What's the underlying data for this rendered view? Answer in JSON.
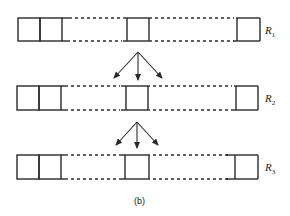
{
  "diagram": {
    "caption": "(b)",
    "rows": [
      {
        "label": "R",
        "subscript": "1"
      },
      {
        "label": "R",
        "subscript": "2"
      },
      {
        "label": "R",
        "subscript": "3"
      }
    ],
    "colors": {
      "stroke": "#2a2a2a",
      "background": "#ffffff"
    }
  }
}
